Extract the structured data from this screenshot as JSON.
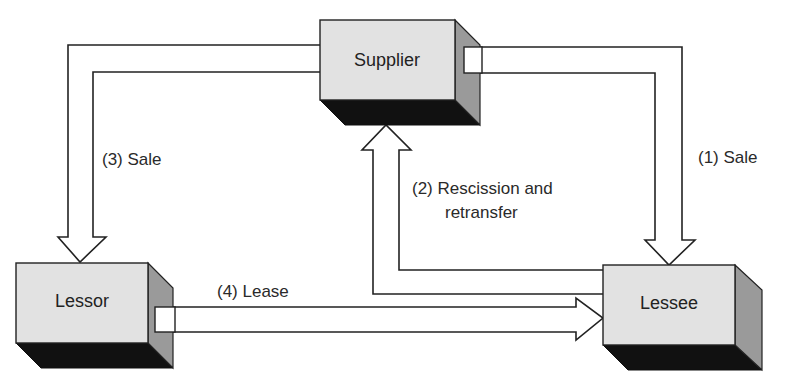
{
  "diagram": {
    "type": "flow",
    "colors": {
      "box_front": "#e2e2e2",
      "box_side": "#9a9a9a",
      "box_bottom": "#111111",
      "arrow_fill": "#ffffff",
      "stroke": "#222222",
      "text": "#2a2a2a"
    },
    "nodes": [
      {
        "id": "supplier",
        "label": "Supplier"
      },
      {
        "id": "lessor",
        "label": "Lessor"
      },
      {
        "id": "lessee",
        "label": "Lessee"
      }
    ],
    "edges": [
      {
        "id": "e1",
        "from": "supplier",
        "to": "lessee",
        "label": "(1) Sale"
      },
      {
        "id": "e2",
        "from": "lessee",
        "to": "supplier",
        "label_line1": "(2) Rescission and",
        "label_line2": "retransfer"
      },
      {
        "id": "e3",
        "from": "supplier",
        "to": "lessor",
        "label": "(3) Sale"
      },
      {
        "id": "e4",
        "from": "lessor",
        "to": "lessee",
        "label": "(4) Lease"
      }
    ]
  }
}
